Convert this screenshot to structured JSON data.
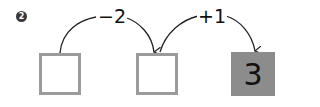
{
  "problem": {
    "number": "2"
  },
  "boxes": [
    {
      "value": "",
      "filled": false
    },
    {
      "value": "",
      "filled": false
    },
    {
      "value": "3",
      "filled": true
    }
  ],
  "operations": [
    {
      "label": "−2",
      "from": 0,
      "to": 1
    },
    {
      "label": "+1",
      "from": 1,
      "to": 2
    }
  ],
  "colors": {
    "box_border": "#9b9b9b",
    "filled_box": "#8c8c8c",
    "line": "#222222"
  }
}
